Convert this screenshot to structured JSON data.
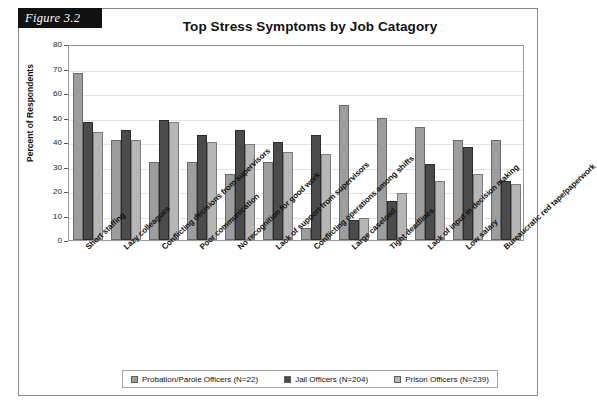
{
  "figure": {
    "tab_label": "Figure 3.2"
  },
  "chart_data": {
    "type": "bar",
    "title": "Top Stress Symptoms by Job Catagory",
    "xlabel": "",
    "ylabel": "Percent of Respondents",
    "ylim": [
      0,
      80
    ],
    "ytick_step": 10,
    "yticks": [
      0,
      10,
      20,
      30,
      40,
      50,
      60,
      70,
      80
    ],
    "grid": true,
    "grid_axis": "y",
    "legend_position": "bottom",
    "categories": [
      "Short staffing",
      "Lazy colleagues",
      "Conflicting decisions from supervisors",
      "Poor communication",
      "No recognition for good work",
      "Lack of support from supervisors",
      "Conflicting operations among shifts",
      "Large caseload",
      "Tight deadlines",
      "Lack of input in decision making",
      "Low salary",
      "Bureaucratic red tape/paperwork"
    ],
    "series": [
      {
        "name": "Probation/Parole Officers (N=22)",
        "color": "#9d9d9d",
        "values": [
          68,
          41,
          32,
          32,
          27,
          32,
          5,
          55,
          50,
          46,
          41,
          41
        ]
      },
      {
        "name": "Jail Officers (N=204)",
        "color": "#4b4b4b",
        "values": [
          48,
          45,
          49,
          43,
          45,
          40,
          43,
          8,
          16,
          31,
          38,
          24
        ]
      },
      {
        "name": "Prison Officers (N=239)",
        "color": "#b6b6b6",
        "values": [
          44,
          41,
          48,
          40,
          39,
          36,
          35,
          9,
          19,
          24,
          27,
          23
        ]
      }
    ]
  }
}
